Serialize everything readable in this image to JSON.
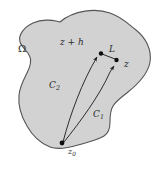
{
  "figure": {
    "type": "complex-analysis-contour-diagram",
    "background_color": "#ffffff",
    "region": {
      "name": "Omega",
      "label": "Ω",
      "fill_color": "#d2d2d2",
      "stroke_color": "#555555",
      "stroke_width": 1
    },
    "labels": {
      "omega": "Ω",
      "z_plus_h": "z + h",
      "segment_L": "L",
      "point_z": "z",
      "contour_C2": "C",
      "contour_C2_sub": "2",
      "contour_C1": "C",
      "contour_C1_sub": "1",
      "base_point_z0": "z",
      "base_point_z0_sub": "0"
    },
    "points": [
      {
        "name": "z0",
        "x": 62,
        "y": 143,
        "label": "z₀"
      },
      {
        "name": "z_plus_h",
        "x": 101,
        "y": 54,
        "label": "z + h"
      },
      {
        "name": "z",
        "x": 117,
        "y": 61,
        "label": "z"
      }
    ],
    "paths": [
      {
        "name": "C2",
        "label": "C₂",
        "from": "z0",
        "to": "z_plus_h"
      },
      {
        "name": "C1",
        "label": "C₁",
        "from": "z0",
        "to": "z"
      },
      {
        "name": "L",
        "label": "L",
        "from": "z_plus_h",
        "to": "z"
      }
    ],
    "line_color": "#1a1a1a",
    "text_color": "#2b2b2b"
  }
}
